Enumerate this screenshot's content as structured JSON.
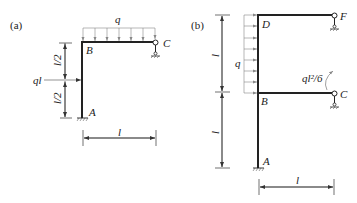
{
  "figure_a": {
    "tag": "(a)",
    "load_label": "q",
    "point_load_label": "ql",
    "node_B": "B",
    "node_C": "C",
    "node_A": "A",
    "dim_upper": "l/2",
    "dim_lower": "l/2",
    "dim_horizontal": "l"
  },
  "figure_b": {
    "tag": "(b)",
    "load_label": "q",
    "moment_label": "ql²/6",
    "node_D": "D",
    "node_F": "F",
    "node_B": "B",
    "node_C": "C",
    "node_A": "A",
    "dim_upper": "l",
    "dim_lower": "l",
    "dim_horizontal": "l"
  },
  "colors": {
    "member": "#222222",
    "load": "#888888",
    "background": "#ffffff"
  }
}
